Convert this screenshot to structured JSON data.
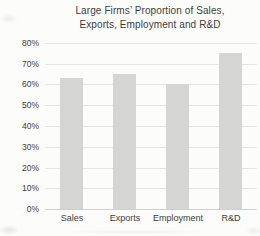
{
  "chart_title": {
    "line1": "Large Firms’ Proportion of Sales,",
    "line2": "Exports, Employment and R&D"
  },
  "chart_data": {
    "type": "bar",
    "title": "Large Firms’ Proportion of Sales, Exports, Employment and R&D",
    "categories": [
      "Sales",
      "Exports",
      "Employment",
      "R&D"
    ],
    "values": [
      63,
      65,
      60,
      75
    ],
    "unit": "%",
    "xlabel": "",
    "ylabel": "",
    "ylim": [
      0,
      80
    ],
    "ytick_step": 10,
    "ytick_labels": [
      "0%",
      "10%",
      "20%",
      "30%",
      "40%",
      "50%",
      "60%",
      "70%",
      "80%"
    ],
    "grid": true,
    "legend": false,
    "colors": {
      "bar": "#d5d5d3",
      "gridline": "#e4e4e2",
      "axis_line": "#cfcfcd",
      "text": "#3d3d3d",
      "background": "#fcfcfb"
    }
  }
}
